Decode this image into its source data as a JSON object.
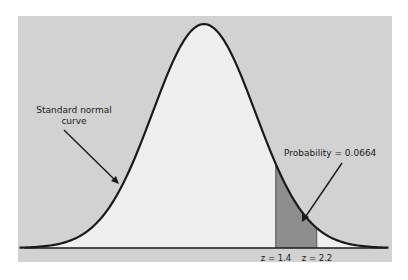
{
  "chart_data": {
    "type": "area",
    "title": "",
    "x_domain": [
      -3.6,
      3.6
    ],
    "mean": 0,
    "sd": 1,
    "shaded_region": {
      "from": 1.4,
      "to": 2.2,
      "probability": 0.0664
    },
    "tick_labels": [
      "z = 1.4",
      "z = 2.2"
    ],
    "annotations": [
      {
        "text": "Standard normal curve",
        "points_to": "curve (left side)"
      },
      {
        "text": "Probability = 0.0664",
        "points_to": "shaded region"
      }
    ],
    "grid": false,
    "legend": "none"
  },
  "labels": {
    "curve_line1": "Standard normal",
    "curve_line2": "curve",
    "probability": "Probability = 0.0664",
    "z_low": "z = 1.4",
    "z_high": "z = 2.2"
  },
  "colors": {
    "background": "#d2d2d2",
    "under_curve": "#efefef",
    "shaded": "#8e8e8e",
    "line": "#1a1a1a"
  }
}
